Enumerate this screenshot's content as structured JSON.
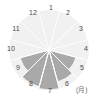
{
  "chart_data": {
    "type": "pie",
    "subtype": "polar-area-rose",
    "title": "",
    "xlabel": "(月)",
    "ylabel": "",
    "grid": false,
    "legend": "none",
    "start_angle_deg": 0,
    "direction": "clockwise",
    "sector_count": 12,
    "rmax": 40,
    "categories": [
      "1",
      "2",
      "3",
      "4",
      "5",
      "6",
      "7",
      "8",
      "9",
      "10",
      "11",
      "12"
    ],
    "values": [
      2,
      2,
      2,
      2,
      28,
      33,
      40,
      38,
      30,
      2,
      2,
      2
    ],
    "colors": {
      "active_fill": "#a9a9a9",
      "inactive_fill": "#f1f1f1",
      "separator": "#ffffff",
      "label": "#4a4a4a",
      "unit_label": "#6a6a6a",
      "background": "#ffffff"
    },
    "tick_labels": [
      {
        "label": "1",
        "x": 47,
        "y": 4,
        "w": 8
      },
      {
        "label": "2",
        "x": 64,
        "y": 9,
        "w": 8
      },
      {
        "label": "3",
        "x": 77,
        "y": 25,
        "w": 8
      },
      {
        "label": "4",
        "x": 82,
        "y": 45,
        "w": 8
      },
      {
        "label": "5",
        "x": 78,
        "y": 64,
        "w": 8
      },
      {
        "label": "6",
        "x": 63,
        "y": 80,
        "w": 8
      },
      {
        "label": "7",
        "x": 46,
        "y": 87,
        "w": 8
      },
      {
        "label": "8",
        "x": 27,
        "y": 80,
        "w": 8
      },
      {
        "label": "9",
        "x": 14,
        "y": 64,
        "w": 8
      },
      {
        "label": "10",
        "x": 5,
        "y": 45,
        "w": 12
      },
      {
        "label": "11",
        "x": 10,
        "y": 25,
        "w": 12
      },
      {
        "label": "12",
        "x": 27,
        "y": 9,
        "w": 12
      }
    ],
    "axis_unit": {
      "label": "(月)",
      "x": 76,
      "y": 86
    }
  }
}
